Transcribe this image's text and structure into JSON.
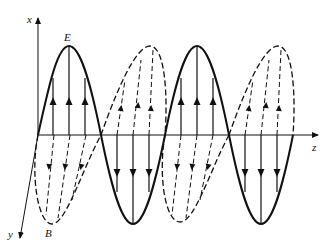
{
  "figure": {
    "labels": {
      "x_axis": "x",
      "y_axis": "y",
      "z_axis": "z",
      "electric_field": "E",
      "magnetic_field": "B"
    },
    "colors": {
      "line": "#111111",
      "background": "#ffffff"
    },
    "e_wave": {
      "style": "solid",
      "field_arrows_up_lobes": 2,
      "field_arrows_down_lobes": 2,
      "arrows_per_lobe": 3
    },
    "b_wave": {
      "style": "dashed",
      "field_arrows_up_lobes": 2,
      "field_arrows_down_lobes": 2,
      "arrows_per_lobe": 3
    }
  }
}
